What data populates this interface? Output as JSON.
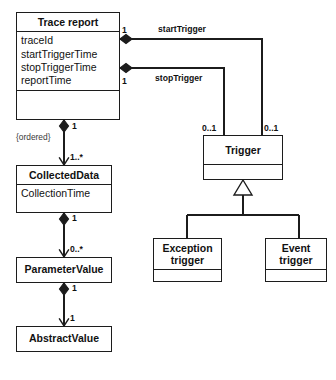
{
  "diagram": {
    "type": "uml-class-diagram",
    "background": "#ffffff",
    "line_color": "#1c1c1c",
    "classes": [
      {
        "id": "trace-report",
        "name": "Trace report",
        "attributes": [
          "traceId",
          "startTriggerTime",
          "stopTriggerTime",
          "reportTime"
        ],
        "has_operations_compartment": true
      },
      {
        "id": "collected-data",
        "name": "CollectedData",
        "attributes": [
          "CollectionTime"
        ],
        "has_operations_compartment": false
      },
      {
        "id": "parameter-value",
        "name": "ParameterValue",
        "attributes": [],
        "has_operations_compartment": false
      },
      {
        "id": "abstract-value",
        "name": "AbstractValue",
        "attributes": [],
        "has_operations_compartment": false
      },
      {
        "id": "trigger",
        "name": "Trigger",
        "attributes": [],
        "has_operations_compartment": true
      },
      {
        "id": "exception-trigger",
        "name_line1": "Exception",
        "name_line2": "trigger",
        "attributes": [],
        "has_operations_compartment": true
      },
      {
        "id": "event-trigger",
        "name_line1": "Event",
        "name_line2": "trigger",
        "attributes": [],
        "has_operations_compartment": true
      }
    ],
    "associations": [
      {
        "id": "start-trigger",
        "label": "startTrigger",
        "from": "trace-report",
        "to": "trigger",
        "kind": "composition",
        "source_multiplicity": "1",
        "target_multiplicity": "0..1"
      },
      {
        "id": "stop-trigger",
        "label": "stopTrigger",
        "from": "trace-report",
        "to": "trigger",
        "kind": "composition",
        "source_multiplicity": "1",
        "target_multiplicity": "0..1"
      },
      {
        "id": "trace-to-collected",
        "label": "",
        "from": "trace-report",
        "to": "collected-data",
        "kind": "composition",
        "source_multiplicity": "1",
        "target_multiplicity": "1..*",
        "constraint": "{ordered}"
      },
      {
        "id": "collected-to-parameter",
        "label": "",
        "from": "collected-data",
        "to": "parameter-value",
        "kind": "composition",
        "source_multiplicity": "1",
        "target_multiplicity": "0..*"
      },
      {
        "id": "parameter-to-abstract",
        "label": "",
        "from": "parameter-value",
        "to": "abstract-value",
        "kind": "composition",
        "source_multiplicity": "1",
        "target_multiplicity": "1"
      }
    ],
    "generalizations": [
      {
        "id": "gen-exception",
        "parent": "trigger",
        "child": "exception-trigger"
      },
      {
        "id": "gen-event",
        "parent": "trigger",
        "child": "event-trigger"
      }
    ],
    "labels": {
      "start_trigger": "startTrigger",
      "stop_trigger": "stopTrigger",
      "ordered": "{ordered}",
      "mult_one_a": "1",
      "mult_one_b": "1",
      "mult_one_c": "1",
      "mult_one_d": "1",
      "mult_one_e": "1",
      "mult_one_star": "1..*",
      "mult_zero_star": "0..*",
      "mult_zero_one_left": "0..1",
      "mult_zero_one_right": "0..1"
    }
  }
}
